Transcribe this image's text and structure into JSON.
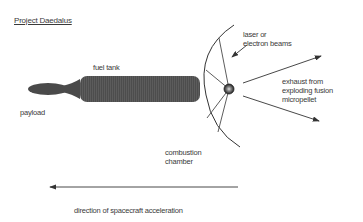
{
  "title": "Project Daedalus",
  "labels": {
    "fuel_tank": "fuel tank",
    "payload": "payload",
    "beams_line1": "laser or",
    "beams_line2": "electron beams",
    "exhaust_line1": "exhaust from",
    "exhaust_line2": "exploding fusion",
    "exhaust_line3": "micropellet",
    "chamber_line1": "combustion",
    "chamber_line2": "chamber",
    "direction": "direction of spacecraft acceleration"
  },
  "colors": {
    "body": "#4a4a4a",
    "line": "#3a3a3a",
    "text": "#3a3a3a"
  }
}
